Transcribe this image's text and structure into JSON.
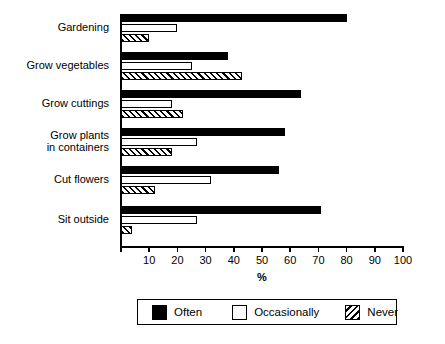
{
  "chart_data": {
    "type": "bar",
    "orientation": "horizontal",
    "title": "",
    "xlabel": "%",
    "ylabel": "",
    "xlim": [
      0,
      100
    ],
    "xticks": [
      0,
      10,
      20,
      30,
      40,
      50,
      60,
      70,
      80,
      90,
      100
    ],
    "xtick_labels": [
      "",
      "10",
      "20",
      "30",
      "40",
      "50",
      "60",
      "70",
      "80",
      "90",
      "100"
    ],
    "grid": false,
    "legend_position": "bottom",
    "categories": [
      "Gardening",
      "Grow vegetables",
      "Grow cuttings",
      "Grow plants in containers",
      "Cut flowers",
      "Sit outside"
    ],
    "series": [
      {
        "name": "Often",
        "values": [
          80,
          38,
          64,
          58,
          56,
          71
        ],
        "color": "#000000",
        "fill": "solid"
      },
      {
        "name": "Occasionally",
        "values": [
          20,
          25,
          18,
          27,
          32,
          27
        ],
        "color": "#ffffff",
        "fill": "empty"
      },
      {
        "name": "Never",
        "values": [
          10,
          43,
          22,
          18,
          12,
          4
        ],
        "color": "#ffffff",
        "fill": "hatched"
      }
    ]
  },
  "category_labels": [
    {
      "line1": "Gardening",
      "line2": ""
    },
    {
      "line1": "Grow vegetables",
      "line2": ""
    },
    {
      "line1": "Grow cuttings",
      "line2": ""
    },
    {
      "line1": "Grow plants",
      "line2": "in containers"
    },
    {
      "line1": "Cut flowers",
      "line2": ""
    },
    {
      "line1": "Sit outside",
      "line2": ""
    }
  ],
  "legend": {
    "items": [
      {
        "label": "Often",
        "swatch": "solid-black-swatch"
      },
      {
        "label": "Occasionally",
        "swatch": "empty-white-swatch"
      },
      {
        "label": "Never",
        "swatch": "hatched-swatch"
      }
    ]
  }
}
